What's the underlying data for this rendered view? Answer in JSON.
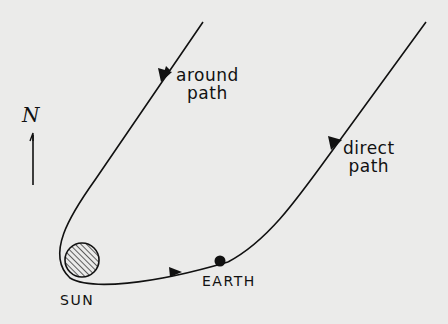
{
  "diagram": {
    "type": "trajectory",
    "labels": {
      "around_path": [
        "around",
        "path"
      ],
      "direct_path": [
        "direct",
        "path"
      ],
      "sun": "SUN",
      "earth": "EARTH",
      "north": "N"
    },
    "colors": {
      "background": "#ebebea",
      "ink": "#111111"
    }
  }
}
